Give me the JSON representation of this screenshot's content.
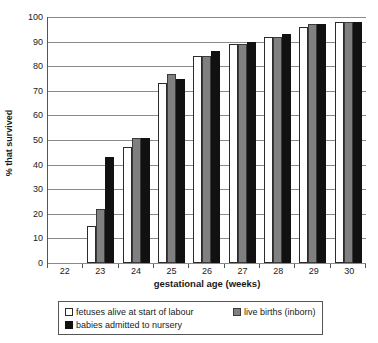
{
  "chart_data": {
    "type": "bar",
    "title": "",
    "subtitle": "",
    "xlabel": "gestational age (weeks)",
    "ylabel": "% that survived",
    "categories": [
      "22",
      "23",
      "24",
      "25",
      "26",
      "27",
      "28",
      "29",
      "30"
    ],
    "ylim": [
      0,
      100
    ],
    "yticks": [
      0,
      10,
      20,
      30,
      40,
      50,
      60,
      70,
      80,
      90,
      100
    ],
    "ytick_labels": [
      "0",
      "10",
      "20",
      "30",
      "40",
      "50",
      "60",
      "70",
      "80",
      "90",
      "100"
    ],
    "grid": true,
    "legend_position": "below-plot",
    "series": [
      {
        "name": "fetuses alive at start of labour",
        "color": "#ffffff",
        "values": [
          0,
          15,
          47,
          73,
          84,
          89,
          92,
          96,
          98
        ]
      },
      {
        "name": "live births (inborn)",
        "color": "#808080",
        "values": [
          0,
          22,
          51,
          77,
          84,
          89,
          92,
          97,
          98
        ]
      },
      {
        "name": "babies admitted to nursery",
        "color": "#111111",
        "values": [
          0,
          43,
          51,
          75,
          86,
          90,
          93,
          97,
          98
        ]
      }
    ]
  },
  "legend": {
    "items": [
      {
        "label": "fetuses alive at start of labour",
        "swatch": "white-square-swatch"
      },
      {
        "label": "live births (inborn)",
        "swatch": "gray-square-swatch"
      },
      {
        "label": "babies admitted to nursery",
        "swatch": "black-square-swatch"
      }
    ]
  },
  "colors": {
    "series_white": "#ffffff",
    "series_gray": "#808080",
    "series_black": "#111111",
    "axis": "#555555",
    "grid": "#8a8a8a",
    "text": "#1a1a1a"
  }
}
